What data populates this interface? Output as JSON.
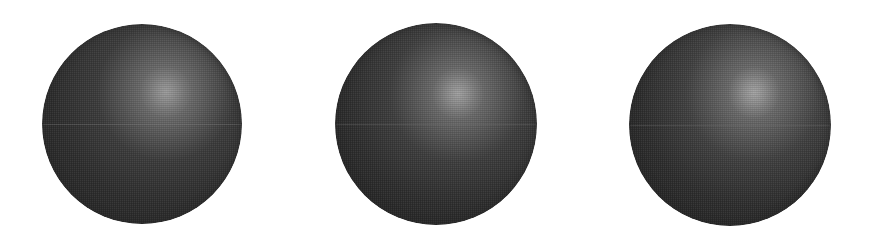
{
  "scene": {
    "background": "#ffffff",
    "description": "Three shaded gray spheres side by side, each lit from the upper right with a specular highlight and a lower-right rim reflection of increasing strength"
  },
  "spheres": [
    {
      "label": "sphere-1",
      "cx": 142,
      "cy": 124,
      "r": 100,
      "base_dark": "#262626",
      "base_mid": "#3c3c3c",
      "highlight_color": "#8e8e8e",
      "highlight_pos": [
        62,
        34
      ],
      "rim_color": "#9a9a9a",
      "rim_strength": 0.45,
      "rim_width": 18,
      "scanline_y": 120
    },
    {
      "label": "sphere-2",
      "cx": 436,
      "cy": 124,
      "r": 101,
      "base_dark": "#242424",
      "base_mid": "#3e3e3e",
      "highlight_color": "#959595",
      "highlight_pos": [
        61,
        35
      ],
      "rim_color": "#a4a4a4",
      "rim_strength": 0.65,
      "rim_width": 24,
      "scanline_y": 120
    },
    {
      "label": "sphere-3",
      "cx": 730,
      "cy": 125,
      "r": 101,
      "base_dark": "#242424",
      "base_mid": "#404040",
      "highlight_color": "#9a9a9a",
      "highlight_pos": [
        62,
        34
      ],
      "rim_color": "#ababab",
      "rim_strength": 0.85,
      "rim_width": 30,
      "scanline_y": 120
    }
  ]
}
